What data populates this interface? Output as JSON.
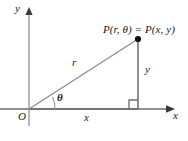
{
  "figure": {
    "type": "polar-cartesian-right-triangle-diagram",
    "background": "#ffffff",
    "stroke_color": "#6b6b6b",
    "text_color": "#1a1a1a",
    "width": 188,
    "height": 141
  },
  "axes": {
    "x_label": "x",
    "y_label": "y",
    "origin_label": "O",
    "origin": {
      "x": 29,
      "y": 109
    },
    "x_axis": {
      "x1": 0,
      "y1": 109,
      "x2": 172,
      "y2": 109,
      "arrow": "right"
    },
    "y_axis": {
      "x1": 29,
      "y1": 125,
      "x2": 29,
      "y2": 10,
      "arrow": "up"
    }
  },
  "point": {
    "label": "P(r, θ) = P(x, y)",
    "label_parts": {
      "name": "P",
      "polar": "(r, θ)",
      "equals": "=",
      "cartesian": "P(x, y)"
    },
    "coords_px": {
      "x": 138,
      "y": 39
    },
    "marker": "filled-dot"
  },
  "segments": {
    "radius": {
      "label": "r",
      "from": "origin",
      "to": "point"
    },
    "vertical": {
      "label": "y",
      "from": {
        "x": 138,
        "y": 39
      },
      "to": {
        "x": 138,
        "y": 109
      }
    },
    "horizontal": {
      "label": "x",
      "from": {
        "x": 29,
        "y": 109
      },
      "to": {
        "x": 138,
        "y": 109
      }
    }
  },
  "angle": {
    "label": "θ",
    "name": "theta",
    "vertex": "origin",
    "arc": "between x-axis and radius"
  },
  "right_angle": {
    "marker": "square",
    "at": {
      "x": 138,
      "y": 109
    },
    "size": 9
  }
}
